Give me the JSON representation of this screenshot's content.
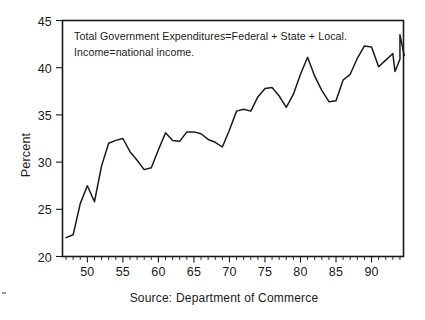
{
  "chart_data": {
    "type": "line",
    "title": "",
    "subtitle": "",
    "xlabel": "",
    "ylabel": "Percent",
    "xlim": [
      1946.5,
      1994.5
    ],
    "ylim": [
      20,
      45
    ],
    "grid": false,
    "legend": null,
    "source_note": "Source: Department of Commerce",
    "annotations": [
      "Total Government Expenditures=Federal + State + Local.",
      "Income=national income."
    ],
    "y_ticks": [
      20,
      25,
      30,
      35,
      40,
      45
    ],
    "y_tick_labels": [
      "20",
      "25",
      "30",
      "35",
      "40",
      "45"
    ],
    "x_ticks": [
      1950,
      1955,
      1960,
      1965,
      1970,
      1975,
      1980,
      1985,
      1990
    ],
    "x_tick_labels": [
      "50",
      "55",
      "60",
      "65",
      "70",
      "75",
      "80",
      "85",
      "90"
    ],
    "x_minor_tick_step": 1,
    "series": [
      {
        "name": "Total Government Expenditures as Percent of National Income",
        "color": "#1a1a1a",
        "x": [
          1947,
          1948,
          1949,
          1950,
          1951,
          1952,
          1953,
          1954,
          1955,
          1956,
          1957,
          1958,
          1959,
          1960,
          1961,
          1962,
          1963,
          1964,
          1965,
          1966,
          1967,
          1968,
          1969,
          1970,
          1971,
          1972,
          1973,
          1974,
          1975,
          1976,
          1977,
          1978,
          1979,
          1980,
          1981,
          1982,
          1983,
          1984,
          1985,
          1986,
          1987,
          1988,
          1989,
          1990,
          1991,
          1992,
          1993,
          1994
        ],
        "values": [
          22.0,
          22.3,
          25.6,
          27.5,
          25.8,
          29.6,
          32.0,
          32.3,
          32.5,
          31.1,
          30.2,
          29.2,
          29.4,
          31.3,
          33.1,
          32.3,
          32.2,
          33.2,
          33.2,
          33.0,
          32.4,
          32.1,
          31.6,
          33.4,
          35.4,
          35.6,
          35.4,
          36.9,
          37.8,
          37.9,
          37.0,
          35.8,
          37.2,
          39.3,
          41.1,
          39.1,
          37.6,
          36.4,
          36.5,
          38.7,
          39.3,
          41.0,
          42.3,
          42.2,
          40.1,
          40.8,
          41.5,
          40.9
        ]
      }
    ],
    "series_extra_points": {
      "note": "tail",
      "x": [
        1993.3,
        1994.0,
        1994.6
      ],
      "values": [
        39.6,
        43.5,
        41.3
      ]
    }
  },
  "figure": {
    "background_color": "#ffffff",
    "line_color": "#1a1a1a",
    "frame_color": "#1a1a1a"
  }
}
